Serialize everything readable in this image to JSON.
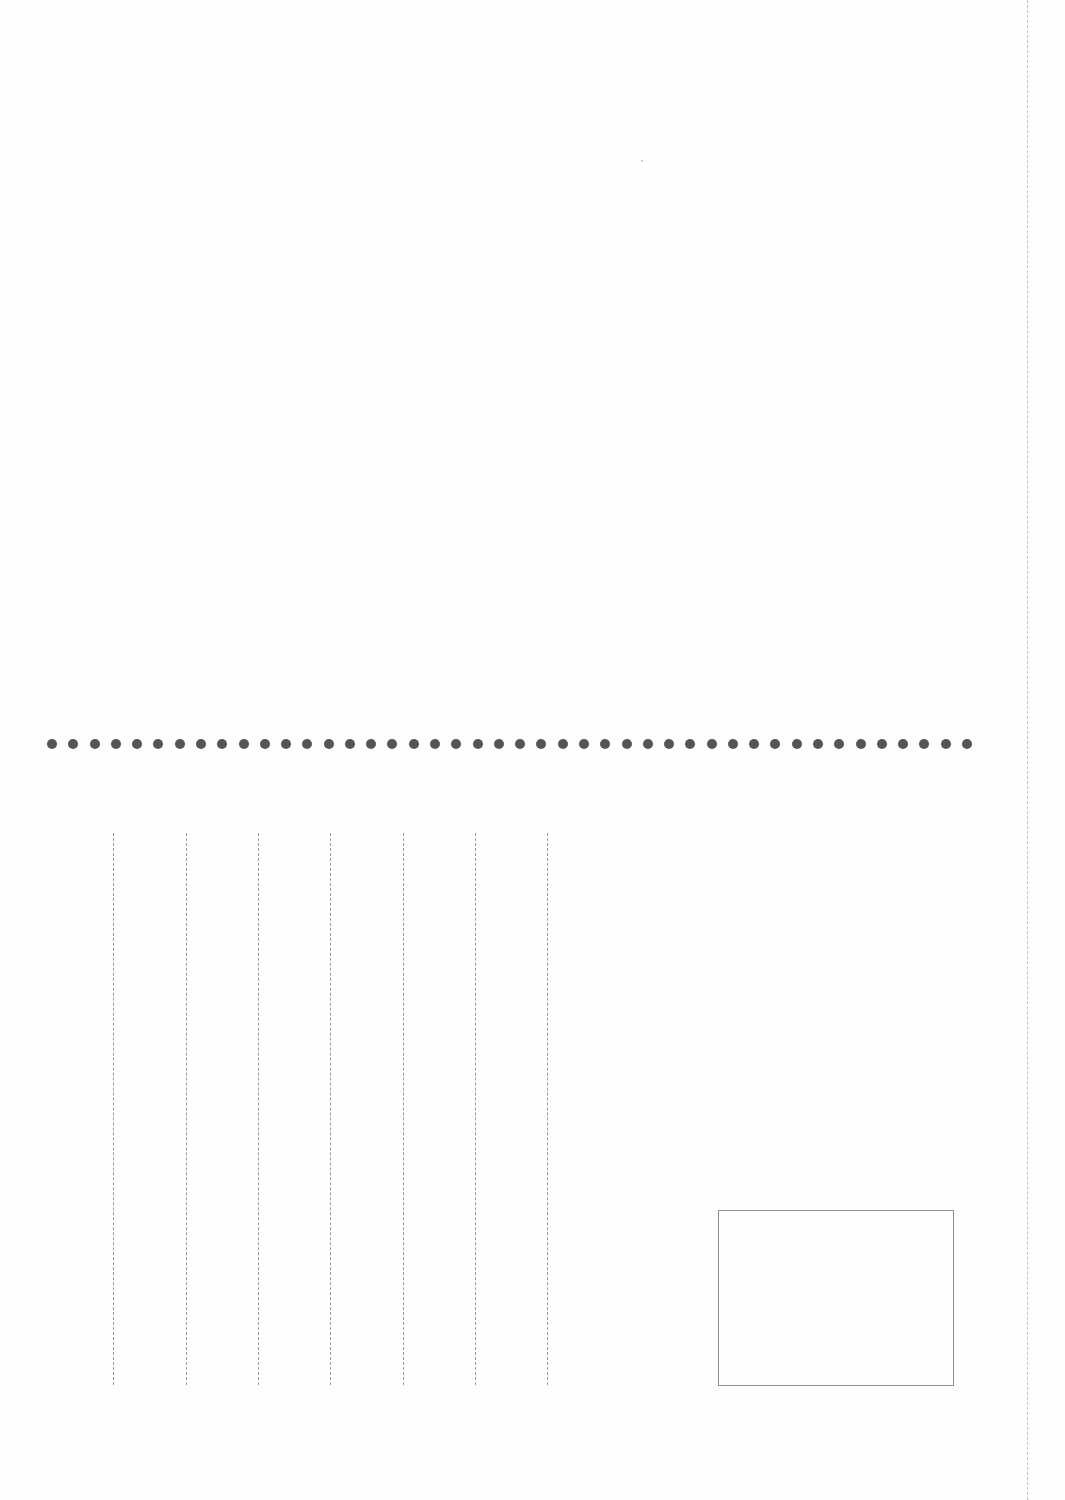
{
  "page": {
    "background": "#fefefe",
    "type": "postcard-back"
  },
  "separator": {
    "style": "dotted",
    "color": "#555555",
    "y": 744,
    "x_start": 52,
    "x_end": 967,
    "dot_count": 44,
    "dot_diameter": 10
  },
  "writing_lines": {
    "orientation": "vertical",
    "style": "dashed",
    "color": "#9a9a9a",
    "y_start": 833,
    "y_end": 1385,
    "x_positions": [
      113,
      186,
      258,
      330,
      403,
      475,
      547
    ]
  },
  "stamp_box": {
    "x": 718,
    "y": 1210,
    "width": 236,
    "height": 176,
    "border_color": "#8e8e8e"
  },
  "cut_line": {
    "style": "dashed",
    "x": 1027,
    "color": "#c4c4c4"
  }
}
